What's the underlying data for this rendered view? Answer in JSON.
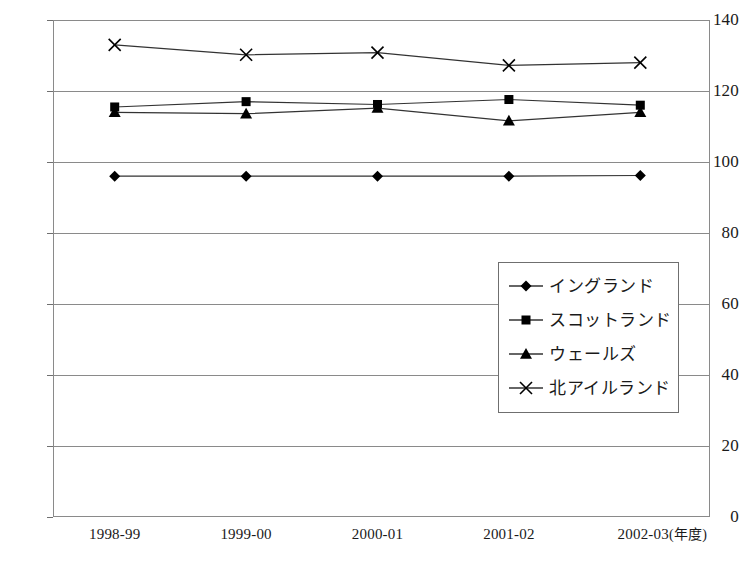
{
  "chart_data": {
    "type": "line",
    "title": "",
    "subtitle": "",
    "xlabel": "年度",
    "ylabel": "",
    "categories": [
      "1998-99",
      "1999-00",
      "2000-01",
      "2001-02",
      "2002-03"
    ],
    "x_axis_unit_label": "(年度)",
    "ylim": [
      0,
      140
    ],
    "y_ticks": [
      0,
      20,
      40,
      60,
      80,
      100,
      120,
      140
    ],
    "grid": "horizontal",
    "legend_position": "inside-right-middle",
    "series": [
      {
        "name": "イングランド",
        "marker": "diamond",
        "values": [
          96,
          96,
          96,
          96,
          96.2
        ]
      },
      {
        "name": "スコットランド",
        "marker": "square",
        "values": [
          115.5,
          117,
          116.2,
          117.6,
          116
        ]
      },
      {
        "name": "ウェールズ",
        "marker": "triangle",
        "values": [
          114,
          113.6,
          115.2,
          111.6,
          114
        ]
      },
      {
        "name": "北アイルランド",
        "marker": "cross",
        "values": [
          133,
          130.2,
          130.8,
          127.2,
          128
        ]
      }
    ]
  },
  "colors": {
    "line": "#333333",
    "marker": "#000000",
    "grid": "#8a8a8a",
    "axis": "#6f6f6f",
    "background": "#ffffff",
    "text": "#1a1a1a"
  }
}
